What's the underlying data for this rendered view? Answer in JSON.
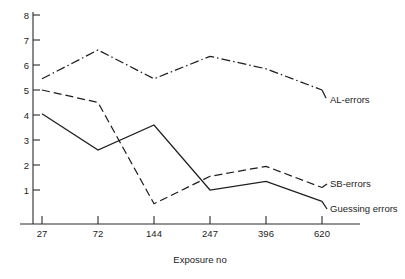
{
  "chart_data": {
    "type": "line",
    "title": "",
    "subtitle": "",
    "xlabel": "Exposure no",
    "ylabel": "",
    "categories": [
      "27",
      "72",
      "144",
      "247",
      "396",
      "620"
    ],
    "x": [
      27,
      72,
      144,
      247,
      396,
      620
    ],
    "yticks": [
      1,
      2,
      3,
      4,
      5,
      6,
      7,
      8
    ],
    "ytick_labels": [
      "1",
      "2",
      "3",
      "4",
      "5",
      "6",
      "7",
      "8"
    ],
    "ylim": [
      0,
      8
    ],
    "xlim_categorical": true,
    "grid": false,
    "legend_position": "right-inline-labels",
    "series": [
      {
        "name": "AL-errors",
        "style": "dash-dot",
        "values": [
          5.45,
          6.6,
          5.45,
          6.35,
          5.85,
          5.0
        ]
      },
      {
        "name": "SB-errors",
        "style": "dashed",
        "values": [
          5.0,
          4.5,
          0.45,
          1.55,
          1.95,
          1.1
        ]
      },
      {
        "name": "Guessing errors",
        "style": "solid",
        "values": [
          4.05,
          2.6,
          3.6,
          1.0,
          1.35,
          0.55
        ]
      }
    ]
  },
  "axes": {
    "y": {
      "tick_labels": [
        "8",
        "7",
        "6",
        "5",
        "4",
        "3",
        "2",
        "1"
      ]
    },
    "x": {
      "tick_labels": [
        "27",
        "72",
        "144",
        "247",
        "396",
        "620"
      ],
      "title": "Exposure no"
    }
  },
  "labels": {
    "al_errors": "AL-errors",
    "sb_errors": "SB-errors",
    "guessing_errors": "Guessing errors"
  },
  "colors": {
    "ink": "#1d1d1d",
    "background": "#ffffff"
  }
}
